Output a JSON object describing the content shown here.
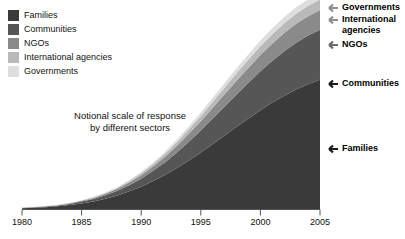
{
  "chart_data": {
    "type": "area",
    "stacked": true,
    "title": "",
    "subtitle": "",
    "caption_line1": "Notional scale of response",
    "caption_line2": "by different sectors",
    "xlabel": "",
    "ylabel": "",
    "x": [
      1980,
      1981,
      1982,
      1983,
      1984,
      1985,
      1986,
      1987,
      1988,
      1989,
      1990,
      1991,
      1992,
      1993,
      1994,
      1995,
      1996,
      1997,
      1998,
      1999,
      2000,
      2001,
      2002,
      2003,
      2004,
      2005
    ],
    "xlim": [
      1980,
      2005
    ],
    "ylim": [
      0,
      100
    ],
    "xticks": [
      1980,
      1985,
      1990,
      1995,
      2000,
      2005
    ],
    "xticklabels": [
      "1980",
      "1985",
      "1990",
      "1995",
      "2000",
      "2005"
    ],
    "yticks": [],
    "yticklabels": [],
    "grid": false,
    "legend_position": "top-left",
    "y_axis_visible": false,
    "series": [
      {
        "name": "Families",
        "color": "#3a3a3a",
        "values": [
          0.4,
          0.6,
          0.9,
          1.3,
          1.9,
          2.7,
          3.7,
          5.0,
          6.6,
          8.6,
          10.9,
          13.6,
          16.6,
          20.0,
          23.7,
          27.6,
          31.7,
          35.9,
          40.1,
          44.2,
          48.2,
          51.9,
          55.3,
          58.3,
          60.9,
          63.0
        ]
      },
      {
        "name": "Communities",
        "color": "#565656",
        "values": [
          0.1,
          0.2,
          0.3,
          0.4,
          0.6,
          0.9,
          1.2,
          1.7,
          2.3,
          3.0,
          3.9,
          5.0,
          6.2,
          7.6,
          9.1,
          10.7,
          12.4,
          14.1,
          15.8,
          17.4,
          19.0,
          20.4,
          21.7,
          22.8,
          23.7,
          24.4
        ]
      },
      {
        "name": "NGOs",
        "color": "#8a8a8a",
        "values": [
          0.05,
          0.08,
          0.12,
          0.18,
          0.26,
          0.37,
          0.52,
          0.71,
          0.96,
          1.28,
          1.66,
          2.12,
          2.64,
          3.23,
          3.87,
          4.54,
          5.24,
          5.94,
          6.62,
          7.27,
          7.87,
          8.4,
          8.85,
          9.21,
          9.48,
          9.65
        ]
      },
      {
        "name": "International agencies",
        "color": "#b9b9b9",
        "values": [
          0.03,
          0.05,
          0.07,
          0.1,
          0.15,
          0.21,
          0.3,
          0.41,
          0.55,
          0.73,
          0.95,
          1.21,
          1.51,
          1.84,
          2.2,
          2.57,
          2.95,
          3.32,
          3.68,
          4.01,
          4.31,
          4.56,
          4.77,
          4.93,
          5.04,
          5.1
        ]
      },
      {
        "name": "Governments",
        "color": "#dedede",
        "values": [
          0.02,
          0.03,
          0.05,
          0.07,
          0.1,
          0.14,
          0.2,
          0.27,
          0.37,
          0.49,
          0.63,
          0.8,
          1.0,
          1.21,
          1.45,
          1.69,
          1.94,
          2.18,
          2.41,
          2.62,
          2.81,
          2.97,
          3.09,
          3.18,
          3.24,
          3.27
        ]
      }
    ]
  },
  "legend": {
    "items": [
      {
        "label": "Families",
        "color": "#3a3a3a"
      },
      {
        "label": "Communities",
        "color": "#565656"
      },
      {
        "label": "NGOs",
        "color": "#8a8a8a"
      },
      {
        "label": "International agencies",
        "color": "#b9b9b9"
      },
      {
        "label": "Governments",
        "color": "#dedede"
      }
    ]
  },
  "annotations": [
    {
      "label": "Governments",
      "icon": "arrow-left-icon"
    },
    {
      "label": "International agencies",
      "icon": "arrow-left-icon"
    },
    {
      "label": "NGOs",
      "icon": "arrow-left-icon"
    },
    {
      "label": "Communities",
      "icon": "arrow-left-icon"
    },
    {
      "label": "Families",
      "icon": "arrow-left-icon"
    }
  ],
  "annotation_labels": {
    "governments": "Governments",
    "international_line1": "International",
    "international_line2": "agencies",
    "ngos": "NGOs",
    "communities": "Communities",
    "families": "Families"
  },
  "axis": {
    "line_color": "#555555",
    "ticks": [
      "1980",
      "1985",
      "1990",
      "1995",
      "2000",
      "2005"
    ]
  }
}
